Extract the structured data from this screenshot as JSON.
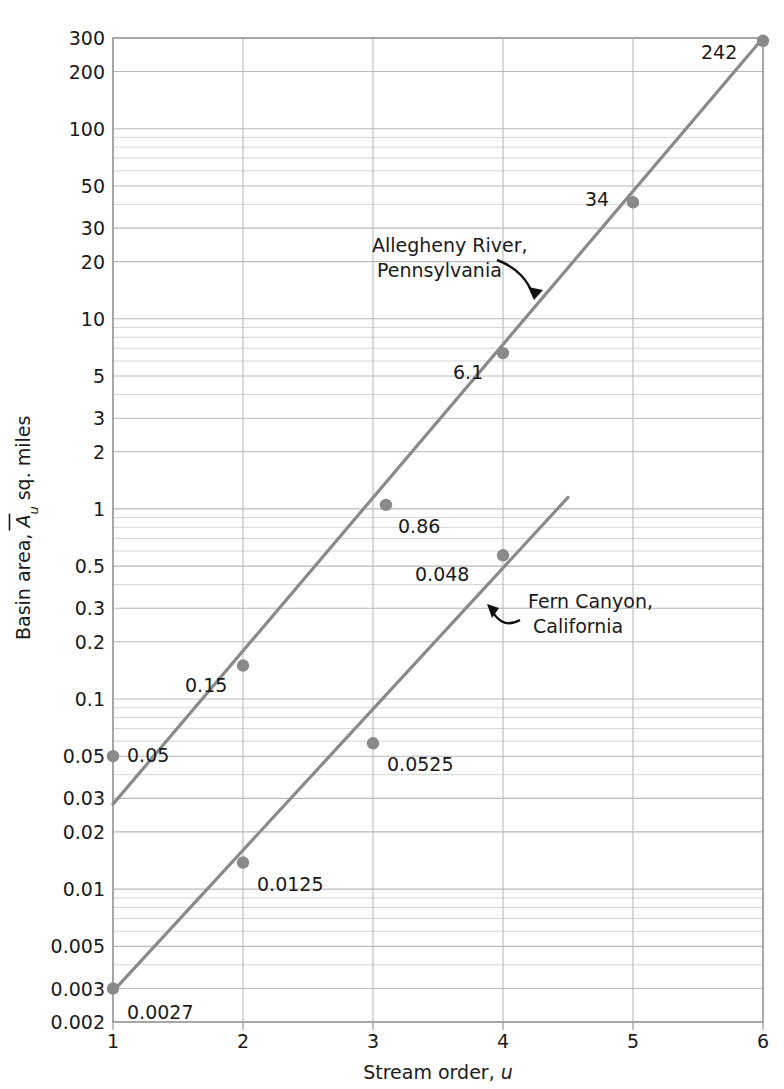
{
  "chart_data": {
    "type": "scatter",
    "title": "",
    "xlabel": "Stream order, u",
    "ylabel": "Basin area, Au sq. miles",
    "ylabel_prefix": "Basin area, ",
    "ylabel_symbol": "A",
    "ylabel_sub": "u",
    "ylabel_suffix": " sq. miles",
    "xlabel_prefix": "Stream order, ",
    "xlabel_symbol": "u",
    "xscale": "linear",
    "yscale": "log",
    "xlim": [
      1,
      6
    ],
    "ylim": [
      0.002,
      300
    ],
    "grid": true,
    "legend": "annotations",
    "xticks": [
      "1",
      "2",
      "3",
      "4",
      "5",
      "6"
    ],
    "xtick_values": [
      1,
      2,
      3,
      4,
      5,
      6
    ],
    "yticks": [
      "300",
      "200",
      "100",
      "50",
      "30",
      "20",
      "10",
      "5",
      "3",
      "2",
      "1",
      "0.5",
      "0.3",
      "0.2",
      "0.1",
      "0.05",
      "0.03",
      "0.02",
      "0.01",
      "0.005",
      "0.003",
      "0.002"
    ],
    "ytick_values": [
      300,
      200,
      100,
      50,
      30,
      20,
      10,
      5,
      3,
      2,
      1,
      0.5,
      0.3,
      0.2,
      0.1,
      0.05,
      0.03,
      0.02,
      0.01,
      0.005,
      0.003,
      0.002
    ],
    "series": [
      {
        "name": "Allegheny River, Pennsylvania",
        "annotation_line1": "Allegheny River,",
        "annotation_line2": "Pennsylvania",
        "color": "#8a8a8a",
        "points": [
          {
            "x": 1,
            "y": 0.05,
            "label": "0.05",
            "label_dx": 14,
            "label_dy": 6
          },
          {
            "x": 2,
            "y": 0.15,
            "label": "0.15",
            "label_dx": -58,
            "label_dy": 26
          },
          {
            "x": 3.1,
            "y": 1.05,
            "label": "0.86",
            "label_dx": 12,
            "label_dy": 28
          },
          {
            "x": 4,
            "y": 6.6,
            "label": "6.1",
            "label_dx": -50,
            "label_dy": 26
          },
          {
            "x": 5,
            "y": 41,
            "label": "34",
            "label_dx": -48,
            "label_dy": 4
          },
          {
            "x": 6,
            "y": 290,
            "label": "242",
            "label_dx": -62,
            "label_dy": 18
          }
        ],
        "fit_line": {
          "x1": 1,
          "y1": 0.028,
          "x2": 6,
          "y2": 300
        }
      },
      {
        "name": "Fern Canyon, California",
        "annotation_line1": "Fern Canyon,",
        "annotation_line2": "California",
        "color": "#8a8a8a",
        "points": [
          {
            "x": 1,
            "y": 0.003,
            "label": "0.0027",
            "label_dx": 14,
            "label_dy": 30
          },
          {
            "x": 2,
            "y": 0.0138,
            "label": "0.0125",
            "label_dx": 14,
            "label_dy": 28
          },
          {
            "x": 3,
            "y": 0.0585,
            "label": "0.0525",
            "label_dx": 14,
            "label_dy": 28
          },
          {
            "x": 4,
            "y": 0.57,
            "label": "0.048",
            "label_dx": -88,
            "label_dy": 26
          }
        ],
        "fit_line": {
          "x1": 1,
          "y1": 0.0029,
          "x2": 4.5,
          "y2": 1.15
        }
      }
    ]
  },
  "axes": {
    "grid_color": "#b9b9b9",
    "frame_color": "#9a9a9a",
    "text_color": "#1a1a1a"
  }
}
